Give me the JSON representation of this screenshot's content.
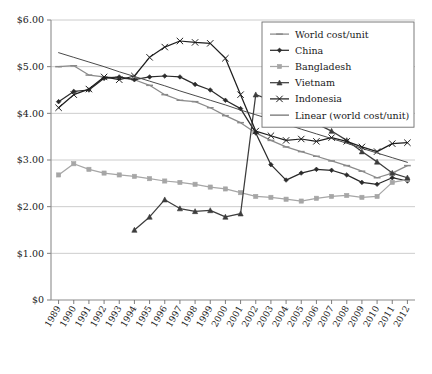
{
  "chart_data": {
    "type": "line",
    "title": "",
    "xlabel": "",
    "ylabel": "",
    "grid": true,
    "legend_position": "top-right",
    "ylim": [
      0,
      6
    ],
    "ytick_labels": [
      "$0",
      "$1.00",
      "$2.00",
      "$3.00",
      "$4.00",
      "$5.00",
      "$6.00"
    ],
    "ytick_values": [
      0,
      1,
      2,
      3,
      4,
      5,
      6
    ],
    "categories": [
      "1989",
      "1990",
      "1991",
      "1992",
      "1993",
      "1994",
      "1995",
      "1996",
      "1997",
      "1998",
      "1999",
      "2000",
      "2001",
      "2002",
      "2003",
      "2004",
      "2005",
      "2006",
      "2007",
      "2008",
      "2009",
      "2010",
      "2011",
      "2012"
    ],
    "series": [
      {
        "name": "World cost/unit",
        "color": "#8a8a8a",
        "marker": "dash",
        "values": [
          5.0,
          5.02,
          4.82,
          4.78,
          4.76,
          4.72,
          4.6,
          4.4,
          4.28,
          4.25,
          4.12,
          3.95,
          3.8,
          3.58,
          3.42,
          3.28,
          3.18,
          3.08,
          2.98,
          2.88,
          2.76,
          2.62,
          2.72,
          2.88
        ]
      },
      {
        "name": "China",
        "color": "#2b2b2b",
        "marker": "diamond",
        "values": [
          4.25,
          4.47,
          4.5,
          4.75,
          4.78,
          4.72,
          4.78,
          4.8,
          4.78,
          4.62,
          4.5,
          4.28,
          4.1,
          3.58,
          2.9,
          2.57,
          2.72,
          2.8,
          2.78,
          2.68,
          2.52,
          2.48,
          2.62,
          2.55
        ]
      },
      {
        "name": "Bangladesh",
        "color": "#a6a6a6",
        "marker": "square",
        "values": [
          2.68,
          2.92,
          2.8,
          2.72,
          2.68,
          2.65,
          2.6,
          2.55,
          2.52,
          2.48,
          2.42,
          2.38,
          2.3,
          2.22,
          2.2,
          2.16,
          2.12,
          2.18,
          2.22,
          2.24,
          2.2,
          2.22,
          2.52,
          2.58
        ]
      },
      {
        "name": "Vietnam",
        "color": "#3d3d3d",
        "marker": "triangle",
        "values": [
          null,
          null,
          null,
          null,
          null,
          1.5,
          1.78,
          2.15,
          1.96,
          1.9,
          1.92,
          1.78,
          1.85,
          4.4,
          4.28,
          4.02,
          3.9,
          3.78,
          3.62,
          3.42,
          3.18,
          2.96,
          2.72,
          2.62
        ]
      },
      {
        "name": "Indonesia",
        "color": "#1f1f1f",
        "marker": "cross",
        "values": [
          4.12,
          4.4,
          4.52,
          4.78,
          4.72,
          4.8,
          5.2,
          5.42,
          5.55,
          5.52,
          5.5,
          5.18,
          4.4,
          3.62,
          3.52,
          3.42,
          3.45,
          3.4,
          3.48,
          3.4,
          3.28,
          3.18,
          3.35,
          3.37
        ]
      },
      {
        "name": "Linear (world cost/unit)",
        "color": "#4a4a4a",
        "marker": "none",
        "values": [
          5.3,
          5.2,
          5.1,
          5.0,
          4.89,
          4.79,
          4.69,
          4.59,
          4.48,
          4.38,
          4.28,
          4.18,
          4.07,
          3.97,
          3.87,
          3.77,
          3.66,
          3.56,
          3.46,
          3.36,
          3.25,
          3.15,
          3.05,
          2.95
        ]
      }
    ]
  },
  "legend": {
    "entries": [
      {
        "label": "World cost/unit"
      },
      {
        "label": "China"
      },
      {
        "label": "Bangladesh"
      },
      {
        "label": "Vietnam"
      },
      {
        "label": "Indonesia"
      },
      {
        "label": "Linear (world cost/unit)"
      }
    ]
  }
}
